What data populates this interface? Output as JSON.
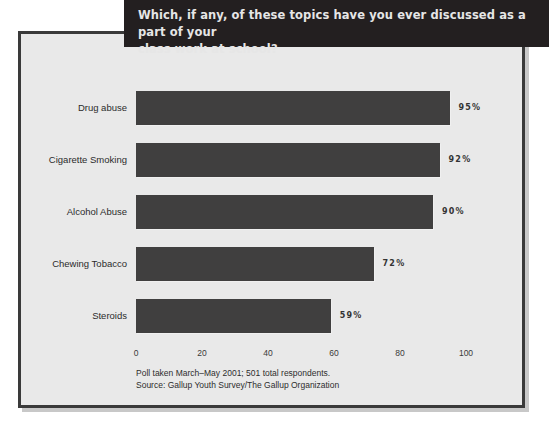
{
  "title": {
    "line1": "Which, if any, of these topics have you ever discussed as a part of your",
    "line2": "class work at school?",
    "full": "Which, if any, of these topics have you ever discussed as a part of your class work at school?"
  },
  "footnote": {
    "line1": "Poll taken March–May 2001; 501 total respondents.",
    "line2": "Source: Gallup Youth Survey/The Gallup Organization"
  },
  "colors": {
    "banner_bg": "#231f20",
    "banner_text": "#e6e6e6",
    "panel_bg": "#e9e9e9",
    "panel_border": "#3a3a3a",
    "bar_fill": "#403f3f",
    "text": "#2b2b2b"
  },
  "chart_data": {
    "type": "bar",
    "orientation": "horizontal",
    "title": "Which, if any, of these topics have you ever discussed as a part of your class work at school?",
    "xlabel": "",
    "ylabel": "",
    "xlim": [
      0,
      100
    ],
    "grid": false,
    "legend": "none",
    "categories": [
      "Drug abuse",
      "Cigarette Smoking",
      "Alcohol Abuse",
      "Chewing Tobacco",
      "Steroids"
    ],
    "values": [
      95,
      92,
      90,
      72,
      59
    ],
    "value_labels": [
      "95%",
      "92%",
      "90%",
      "72%",
      "59%"
    ],
    "xticks": [
      0,
      20,
      40,
      60,
      80,
      100
    ],
    "xtick_labels": [
      "0",
      "20",
      "40",
      "60",
      "80",
      "100"
    ],
    "bars": [
      {
        "label": "Drug abuse",
        "value": 95,
        "value_label": "95%"
      },
      {
        "label": "Cigarette Smoking",
        "value": 92,
        "value_label": "92%"
      },
      {
        "label": "Alcohol Abuse",
        "value": 90,
        "value_label": "90%"
      },
      {
        "label": "Chewing Tobacco",
        "value": 72,
        "value_label": "72%"
      },
      {
        "label": "Steroids",
        "value": 59,
        "value_label": "59%"
      }
    ]
  }
}
